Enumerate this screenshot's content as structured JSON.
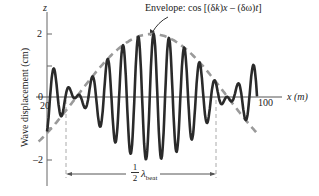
{
  "chart_data": {
    "type": "line",
    "title": "",
    "annotation_envelope": "Envelope: cos [(δk)x – (δω)t]",
    "annotation_halfbeat": "½ λ_beat",
    "xlabel": "x (m)",
    "ylabel": "Wave displacement (cm)",
    "z_axis_label": "z",
    "x_ticks": [
      "0",
      "20",
      "100"
    ],
    "y_ticks": [
      "2",
      "0",
      "–2"
    ],
    "xlim": [
      0,
      110
    ],
    "ylim": [
      -2.6,
      2.8
    ],
    "series": [
      {
        "name": "wave",
        "style": "solid dark",
        "formula": "2·cos(2π(x−50)/144)·cos(2πx/7.3)"
      },
      {
        "name": "envelope",
        "style": "dashed gray",
        "formula": "2·cos(2π(x−50)/144)"
      }
    ],
    "half_beat_markers_x": [
      9,
      80.5
    ],
    "envelope_peak": {
      "x": 50,
      "y": 2
    }
  },
  "labels": {
    "z": "z",
    "y2": "2",
    "y0": "0",
    "x20": "20",
    "yneg2": "–2",
    "x100": "100",
    "xaxis": "x (m)",
    "ylabel": "Wave displacement (cm)",
    "envelope_prefix": "Envelope: cos [(δ",
    "envelope_k": "k",
    "envelope_mid": ")",
    "envelope_x": "x",
    "envelope_mid2": " – (δω)",
    "envelope_t": "t",
    "envelope_end": "]",
    "half_num": "1",
    "half_den": "2",
    "lambda": "λ",
    "beat": "beat"
  },
  "colors": {
    "wave": "#2a2a2a",
    "envelope": "#9a9a9a",
    "axis": "#555555"
  }
}
